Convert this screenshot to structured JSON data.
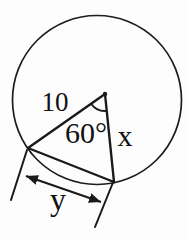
{
  "figure": {
    "labels": {
      "radius_left": "10",
      "central_angle": "60°",
      "radius_right": "x",
      "chord_dimension": "y"
    },
    "colors": {
      "stroke": "#1a1a1a",
      "background": "#fdfdfd",
      "text": "#111111"
    }
  }
}
